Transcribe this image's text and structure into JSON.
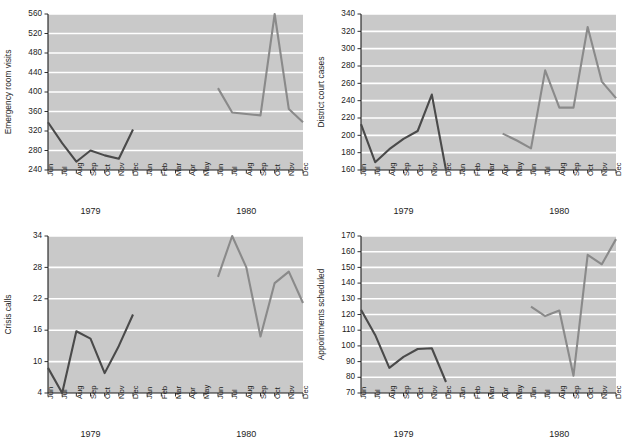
{
  "figure": {
    "background_color": "#ffffff",
    "plot_background_color": "#c9c9c9",
    "gridline_color": "#ffffff",
    "axis_color": "#1c1c1c",
    "series_colors": {
      "1979": "#4a4a4a",
      "1980": "#8a8a8a"
    }
  },
  "months": [
    "Jun",
    "Jul",
    "Aug",
    "Sep",
    "Oct",
    "Nov",
    "Dec",
    "Jan",
    "Feb",
    "Mar",
    "Apr",
    "May",
    "Jun",
    "Jul",
    "Aug",
    "Sep",
    "Oct",
    "Nov",
    "Dec"
  ],
  "year_labels": [
    {
      "text": "1979",
      "index": 3
    },
    {
      "text": "1980",
      "index": 14
    }
  ],
  "chart_data": [
    {
      "id": "emergency-room-visits",
      "type": "line",
      "title": "",
      "xlabel": "",
      "ylabel": "Emergency room visits",
      "ylim": [
        240,
        560
      ],
      "yticks": [
        240,
        280,
        320,
        360,
        400,
        440,
        480,
        520,
        560
      ],
      "grid": true,
      "legend": "none",
      "x": [
        "Jun",
        "Jul",
        "Aug",
        "Sep",
        "Oct",
        "Nov",
        "Dec",
        "Jan",
        "Feb",
        "Mar",
        "Apr",
        "May",
        "Jun",
        "Jul",
        "Aug",
        "Sep",
        "Oct",
        "Nov",
        "Dec"
      ],
      "series": [
        {
          "name": "1979",
          "color": "#4a4a4a",
          "x": [
            "Jun",
            "Jul",
            "Aug",
            "Sep",
            "Oct",
            "Nov",
            "Dec"
          ],
          "x_index": [
            0,
            1,
            2,
            3,
            4,
            5,
            6
          ],
          "values": [
            338,
            295,
            257,
            280,
            270,
            263,
            323
          ]
        },
        {
          "name": "1980",
          "color": "#8a8a8a",
          "x": [
            "Jun",
            "Jul",
            "Aug",
            "Sep",
            "Oct",
            "Nov",
            "Dec"
          ],
          "x_index": [
            12,
            13,
            14,
            15,
            16,
            17,
            18
          ],
          "values": [
            408,
            358,
            355,
            352,
            560,
            365,
            338
          ]
        }
      ]
    },
    {
      "id": "district-court-cases",
      "type": "line",
      "title": "",
      "xlabel": "",
      "ylabel": "District court cases",
      "ylim": [
        160,
        340
      ],
      "yticks": [
        160,
        180,
        200,
        220,
        240,
        260,
        280,
        300,
        320,
        340
      ],
      "grid": true,
      "legend": "none",
      "x": [
        "Jun",
        "Jul",
        "Aug",
        "Sep",
        "Oct",
        "Nov",
        "Dec",
        "Jan",
        "Feb",
        "Mar",
        "Apr",
        "May",
        "Jun",
        "Jul",
        "Aug",
        "Sep",
        "Oct",
        "Nov",
        "Dec"
      ],
      "series": [
        {
          "name": "1979",
          "color": "#4a4a4a",
          "x": [
            "Jun",
            "Jul",
            "Aug",
            "Sep",
            "Oct",
            "Nov",
            "Dec"
          ],
          "x_index": [
            0,
            1,
            2,
            3,
            4,
            5,
            6
          ],
          "values": [
            213,
            169,
            184,
            196,
            205,
            247,
            160
          ]
        },
        {
          "name": "1980",
          "color": "#8a8a8a",
          "x": [
            "Apr",
            "May",
            "Jun",
            "Jul",
            "Aug",
            "Sep",
            "Oct",
            "Nov",
            "Dec"
          ],
          "x_index": [
            10,
            11,
            12,
            13,
            14,
            15,
            16,
            17,
            18
          ],
          "values": [
            202,
            194,
            185,
            275,
            232,
            232,
            325,
            262,
            243
          ]
        }
      ]
    },
    {
      "id": "crisis-calls",
      "type": "line",
      "title": "",
      "xlabel": "",
      "ylabel": "Crisis calls",
      "ylim": [
        4,
        34
      ],
      "yticks": [
        4,
        10,
        16,
        22,
        28,
        34
      ],
      "grid": true,
      "legend": "none",
      "x": [
        "Jun",
        "Jul",
        "Aug",
        "Sep",
        "Oct",
        "Nov",
        "Dec",
        "Jan",
        "Feb",
        "Mar",
        "Apr",
        "May",
        "Jun",
        "Jul",
        "Aug",
        "Sep",
        "Oct",
        "Nov",
        "Dec"
      ],
      "series": [
        {
          "name": "1979",
          "color": "#4a4a4a",
          "x": [
            "Jun",
            "Jul",
            "Aug",
            "Sep",
            "Oct",
            "Nov",
            "Dec"
          ],
          "x_index": [
            0,
            1,
            2,
            3,
            4,
            5,
            6
          ],
          "values": [
            8.8,
            4.0,
            15.8,
            14.4,
            7.8,
            13.0,
            19.0
          ]
        },
        {
          "name": "1980",
          "color": "#8a8a8a",
          "x": [
            "Jun",
            "Jul",
            "Aug",
            "Sep",
            "Oct",
            "Nov",
            "Dec"
          ],
          "x_index": [
            12,
            13,
            14,
            15,
            16,
            17,
            18
          ],
          "values": [
            26.2,
            34.0,
            28.0,
            14.8,
            25.0,
            27.2,
            21.2
          ]
        }
      ]
    },
    {
      "id": "appointments-scheduled",
      "type": "line",
      "title": "",
      "xlabel": "",
      "ylabel": "Appointments scheduled",
      "ylim": [
        70,
        170
      ],
      "yticks": [
        70,
        80,
        90,
        100,
        110,
        120,
        130,
        140,
        150,
        160,
        170
      ],
      "grid": true,
      "legend": "none",
      "x": [
        "Jun",
        "Jul",
        "Aug",
        "Sep",
        "Oct",
        "Nov",
        "Dec",
        "Jan",
        "Feb",
        "Mar",
        "Apr",
        "May",
        "Jun",
        "Jul",
        "Aug",
        "Sep",
        "Oct",
        "Nov",
        "Dec"
      ],
      "series": [
        {
          "name": "1979",
          "color": "#4a4a4a",
          "x": [
            "Jun",
            "Jul",
            "Aug",
            "Sep",
            "Oct",
            "Nov",
            "Dec"
          ],
          "x_index": [
            0,
            1,
            2,
            3,
            4,
            5,
            6
          ],
          "values": [
            123,
            107,
            86,
            93,
            98,
            98.5,
            77
          ]
        },
        {
          "name": "1980",
          "color": "#8a8a8a",
          "x": [
            "Jun",
            "Jul",
            "Aug",
            "Sep",
            "Oct",
            "Nov",
            "Dec"
          ],
          "x_index": [
            12,
            13,
            14,
            15,
            16,
            17,
            18
          ],
          "values": [
            125,
            119,
            122.5,
            81,
            158,
            152,
            168
          ]
        }
      ]
    }
  ]
}
